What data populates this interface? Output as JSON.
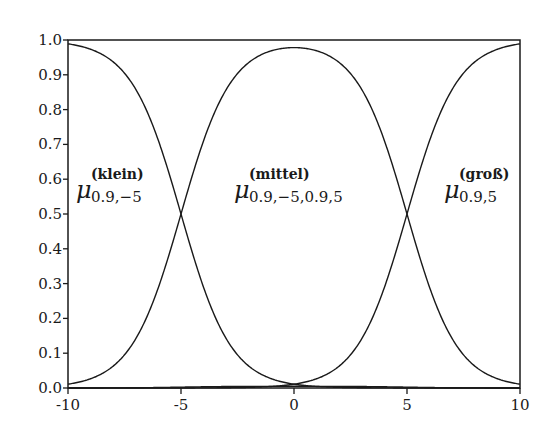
{
  "chart_data": {
    "type": "line",
    "title": "",
    "xlabel": "",
    "ylabel": "",
    "xlim": [
      -10,
      10
    ],
    "ylim": [
      0,
      1
    ],
    "grid": false,
    "x_ticks": [
      "-10",
      "-5",
      "0",
      "5",
      "10"
    ],
    "y_ticks": [
      "0.0",
      "0.1",
      "0.2",
      "0.3",
      "0.4",
      "0.5",
      "0.6",
      "0.7",
      "0.8",
      "0.9",
      "1.0"
    ],
    "series": [
      {
        "name": "klein",
        "function": "1/(1+exp(0.9*(x+5)))",
        "x": [
          -10,
          -7.5,
          -5,
          -2.5,
          0,
          5,
          10
        ],
        "values": [
          0.989,
          0.905,
          0.5,
          0.095,
          0.011,
          0.0,
          0.0
        ]
      },
      {
        "name": "mittel",
        "function": "1/(1+exp(-0.9*(x+5))) * 1/(1+exp(0.9*(x-5)))",
        "x": [
          -10,
          -7.5,
          -5,
          -2.5,
          0,
          2.5,
          5,
          7.5,
          10
        ],
        "values": [
          0.011,
          0.095,
          0.5,
          0.9,
          0.978,
          0.9,
          0.5,
          0.095,
          0.011
        ]
      },
      {
        "name": "groß",
        "function": "1/(1+exp(-0.9*(x-5)))",
        "x": [
          -10,
          0,
          2.5,
          5,
          7.5,
          10
        ],
        "values": [
          0.0,
          0.011,
          0.095,
          0.5,
          0.905,
          0.989
        ]
      },
      {
        "name": "overlap",
        "function": "klein*groß (near zero)",
        "x": [
          -5,
          0,
          5
        ],
        "values": [
          0.0,
          0.011,
          0.0
        ]
      }
    ],
    "annotations": [
      {
        "symbol": "μ",
        "superscript": "(klein)",
        "subscript": "0.9,−5"
      },
      {
        "symbol": "μ",
        "superscript": "(mittel)",
        "subscript": "0.9,−5,0.9,5"
      },
      {
        "symbol": "μ",
        "superscript": "(groß)",
        "subscript": "0.9,5"
      }
    ]
  },
  "labels": {
    "klein": {
      "mu": "μ",
      "sup": "(klein)",
      "sub": "0.9,−5"
    },
    "mittel": {
      "mu": "μ",
      "sup": "(mittel)",
      "sub": "0.9,−5,0.9,5"
    },
    "gross": {
      "mu": "μ",
      "sup": "(groß)",
      "sub": "0.9,5"
    }
  }
}
